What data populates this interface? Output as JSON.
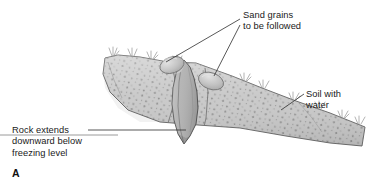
{
  "figure": {
    "panel_letter": "A",
    "background_color": "#ffffff",
    "width": 370,
    "height": 193
  },
  "labels": {
    "sand_grains": {
      "line1": "Sand grains",
      "line2": "to be followed",
      "text": "Sand grains\nto be followed"
    },
    "soil_with_water": {
      "line1": "Soil with",
      "line2": "water",
      "text": "Soil with\nwater"
    },
    "rock_extends": {
      "line1": "Rock extends",
      "line2": "downward below",
      "line3": "freezing level",
      "text": "Rock extends\ndownward below\nfreezing level"
    }
  },
  "diagram": {
    "type": "cross-section-illustration",
    "elements": [
      {
        "name": "soil-mass",
        "description": "sloping speckled soil layer with water",
        "fill": "#c9c9c9",
        "stroke": "#6e6e6e"
      },
      {
        "name": "rock-spire",
        "description": "rock extending downward below freezing level",
        "fill": "#b2b2b2",
        "stroke": "#5a5a5a"
      },
      {
        "name": "sand-grain-left",
        "description": "sand grain to be followed",
        "fill": "#c0c0c0",
        "stroke": "#777777"
      },
      {
        "name": "sand-grain-right",
        "description": "sand grain to be followed",
        "fill": "#bcbcbc",
        "stroke": "#777777"
      },
      {
        "name": "grass-tufts",
        "description": "vegetation along soil surface",
        "stroke": "#8a8a8a"
      },
      {
        "name": "ground-reference-line",
        "description": "horizontal baseline at left",
        "stroke": "#9a9a9a"
      }
    ]
  },
  "colors": {
    "soil_fill": "#c9c9c9",
    "soil_stroke": "#6e6e6e",
    "speckle": "#8e8e8e",
    "rock_fill": "#b2b2b2",
    "rock_stroke": "#5a5a5a",
    "leader_line": "#3a3a3a",
    "text": "#1a1a1a",
    "background": "#ffffff"
  }
}
